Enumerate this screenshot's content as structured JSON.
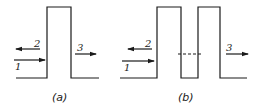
{
  "figure": {
    "panels": [
      {
        "caption": "(a)",
        "description": "single rectangular potential barrier",
        "arrows": [
          {
            "label": "1",
            "direction": "right",
            "meaning": "incident"
          },
          {
            "label": "2",
            "direction": "left",
            "meaning": "reflected"
          },
          {
            "label": "3",
            "direction": "right",
            "meaning": "transmitted"
          }
        ]
      },
      {
        "caption": "(b)",
        "description": "double rectangular potential barrier with dashed level in the well",
        "arrows": [
          {
            "label": "1",
            "direction": "right",
            "meaning": "incident"
          },
          {
            "label": "2",
            "direction": "left",
            "meaning": "reflected"
          },
          {
            "label": "3",
            "direction": "right",
            "meaning": "transmitted"
          }
        ]
      }
    ]
  }
}
